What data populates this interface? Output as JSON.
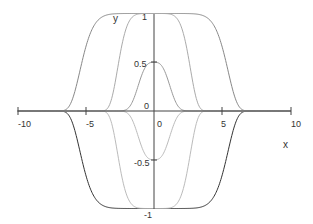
{
  "chart_data": {
    "type": "line",
    "title": "",
    "xlabel": "x",
    "ylabel": "y",
    "xlim": [
      -10,
      10
    ],
    "ylim": [
      -1,
      1
    ],
    "x_ticks": [
      "-10",
      "-5",
      "0",
      "5",
      "10"
    ],
    "y_ticks": [
      "1",
      "0.5",
      "0",
      "-0.5",
      "-1"
    ],
    "grid": false,
    "legend": null,
    "series": [
      {
        "name": "outer-top",
        "color": "#888888",
        "peak": 1,
        "halfwidth": 6.6,
        "power": 6
      },
      {
        "name": "outer-bottom",
        "color": "#333333",
        "peak": -1,
        "halfwidth": 6.6,
        "power": 6
      },
      {
        "name": "middle-top",
        "color": "#aaaaaa",
        "peak": 1,
        "halfwidth": 3.3,
        "power": 4
      },
      {
        "name": "middle-bottom",
        "color": "#bbbbbb",
        "peak": -1,
        "halfwidth": 3.3,
        "power": 4
      },
      {
        "name": "inner-top",
        "color": "#999999",
        "peak": 0.5,
        "halfwidth": 1.6,
        "power": 2
      },
      {
        "name": "inner-bottom",
        "color": "#bbbbbb",
        "peak": -0.5,
        "halfwidth": 1.6,
        "power": 2
      }
    ]
  },
  "labels": {
    "x_axis": "x",
    "y_axis": "y",
    "x_neg10": "-10",
    "x_neg5": "-5",
    "x_0": "0",
    "x_5": "5",
    "x_10": "10",
    "y_1": "1",
    "y_05": "0.5",
    "y_0": "0",
    "y_neg05": "-0.5",
    "y_neg1": "-1"
  }
}
